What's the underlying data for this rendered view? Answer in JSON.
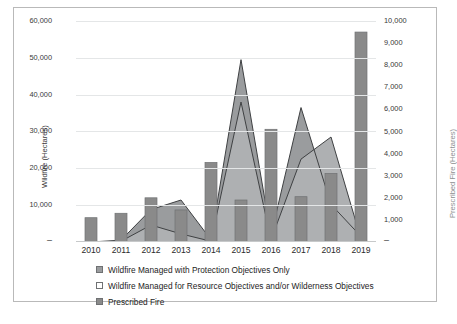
{
  "chart_data": {
    "type": "bar",
    "title": "",
    "subtitle": "",
    "xlabel": "",
    "categories": [
      "2010",
      "2011",
      "2012",
      "2013",
      "2014",
      "2015",
      "2016",
      "2017",
      "2018",
      "2019"
    ],
    "grid": true,
    "legend_position": "bottom-left",
    "axes": {
      "left": {
        "label": "Wildfire (Hectares)",
        "min": 0,
        "max": 60000,
        "tick_values": [
          0,
          10000,
          20000,
          30000,
          40000,
          50000,
          60000
        ],
        "tick_labels": [
          "–",
          "10,000",
          "20,000",
          "30,000",
          "40,000",
          "50,000",
          "60,000"
        ],
        "color": "#3a3a3a"
      },
      "right": {
        "label": "Prescribed Fire (Hectares)",
        "min": 0,
        "max": 10000,
        "tick_values": [
          0,
          1000,
          2000,
          3000,
          4000,
          5000,
          6000,
          7000,
          8000,
          9000,
          10000
        ],
        "tick_labels": [
          "–",
          "1,000",
          "2,000",
          "3,000",
          "4,000",
          "5,000",
          "6,000",
          "7,000",
          "8,000",
          "9,000",
          "10,000"
        ],
        "color": "#8d8f90"
      }
    },
    "series": [
      {
        "name": "Wildfire Managed with Protection Objectives Only",
        "render": "area",
        "axis": "left",
        "color": "#9a9c9e",
        "values": [
          0,
          500,
          8800,
          11400,
          600,
          49500,
          1800,
          36500,
          10200,
          1500
        ]
      },
      {
        "name": "Wildfire Managed for Resource Objectives and/or Wilderness Objectives",
        "render": "area",
        "axis": "left",
        "color": "#aeb0b2",
        "values": [
          0,
          200,
          4600,
          2200,
          200,
          38000,
          600,
          22500,
          28500,
          800
        ]
      },
      {
        "name": "Prescribed Fire",
        "render": "bar",
        "axis": "right",
        "color": "#8a8a8a",
        "values": [
          1100,
          1300,
          2000,
          1450,
          3600,
          1900,
          5100,
          2050,
          3100,
          9500
        ]
      }
    ]
  },
  "legend": {
    "items": [
      {
        "label": "Wildfire Managed with Protection Objectives Only",
        "swatch": "#9a9c9e",
        "swatch_name": "legend-swatch-protection-objectives"
      },
      {
        "label": "Wildfire Managed for Resource Objectives and/or Wilderness Objectives",
        "swatch": "#ffffff",
        "swatch_name": "legend-swatch-resource-objectives"
      },
      {
        "label": "Prescribed Fire",
        "swatch": "#8a8a8a",
        "swatch_name": "legend-swatch-prescribed-fire"
      }
    ]
  },
  "colors": {
    "frame_border": "#b9b9b9",
    "gridline": "#e4e6e7",
    "background": "#ffffff",
    "series_line": "#3f4143"
  }
}
